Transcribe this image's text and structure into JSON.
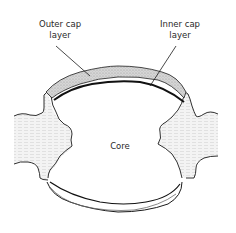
{
  "diagram": {
    "labels": {
      "outer_cap": "Outer cap\nlayer",
      "outer_cap_line1": "Outer cap",
      "outer_cap_line2": "layer",
      "inner_cap_line1": "Inner cap",
      "inner_cap_line2": "layer",
      "core": "Core"
    },
    "colors": {
      "ink": "#1a1a1a",
      "cap_fill": "#c9c9c9",
      "tissue_fill": "#ececec",
      "background": "#ffffff"
    }
  }
}
